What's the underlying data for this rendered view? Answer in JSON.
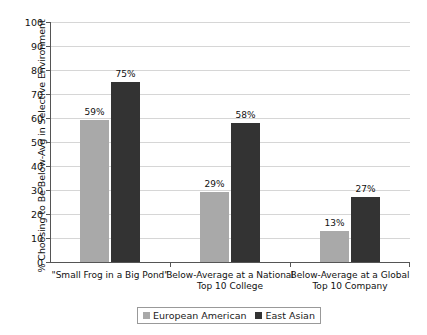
{
  "chart_data": {
    "type": "bar",
    "title": "",
    "xlabel": "",
    "ylabel": "% Choosing to Be Below-Avg in Selective Environment",
    "ylim": [
      0,
      100
    ],
    "ytick_step": 10,
    "yticks": [
      "100",
      "90",
      "80",
      "70",
      "60",
      "50",
      "40",
      "30",
      "20",
      "10",
      "0"
    ],
    "grid": true,
    "legend_position": "bottom",
    "categories": [
      "\"Small Frog in a Big Pond\"",
      "Below-Average at a National Top 10 College",
      "Below-Average at a Global Top 10 Company"
    ],
    "category_lines": [
      [
        "\"Small Frog in a Big Pond\""
      ],
      [
        "Below-Average at a National",
        "Top 10 College"
      ],
      [
        "Below-Average at a Global",
        "Top 10 Company"
      ]
    ],
    "series": [
      {
        "name": "European American",
        "color": "#a9a9a9",
        "values": [
          59,
          29,
          13
        ],
        "labels": [
          "59%",
          "29%",
          "13%"
        ]
      },
      {
        "name": "East Asian",
        "color": "#333333",
        "values": [
          75,
          58,
          27
        ],
        "labels": [
          "75%",
          "58%",
          "27%"
        ]
      }
    ]
  }
}
